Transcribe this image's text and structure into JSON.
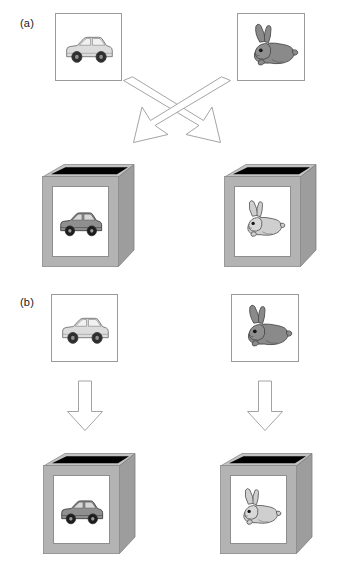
{
  "figure": {
    "background_color": "#ffffff",
    "panels": [
      {
        "id": "a",
        "label": "(a)",
        "condition": "crossed",
        "mapping_description": "car picture maps to rabbit box; rabbit picture maps to car box",
        "cards": [
          {
            "id": "a-card-car",
            "icon": "car-icon",
            "name": "car",
            "fill": "#dcdcdc",
            "stroke": "#6f6f6f"
          },
          {
            "id": "a-card-rabbit",
            "icon": "rabbit-icon",
            "name": "rabbit",
            "fill": "#8a8a8a",
            "stroke": "#4a4a4a"
          }
        ],
        "arrows": [
          {
            "id": "a-arrow-left",
            "icon": "arrow-down-left-icon",
            "direction": "down-left",
            "fill": "#ffffff",
            "stroke": "#9a9a9a"
          },
          {
            "id": "a-arrow-right",
            "icon": "arrow-down-right-icon",
            "direction": "down-right",
            "fill": "#ffffff",
            "stroke": "#9a9a9a"
          }
        ],
        "boxes": [
          {
            "id": "a-box-car",
            "icon": "car-icon",
            "name": "car",
            "front_fill": "#b3b3b3",
            "side_fill": "#9d9d9d",
            "top_fill": "#c2c2c2",
            "slot_fill": "#000000",
            "icon_fill": "#8f8f8f"
          },
          {
            "id": "a-box-rabbit",
            "icon": "rabbit-icon",
            "name": "rabbit",
            "front_fill": "#b3b3b3",
            "side_fill": "#9d9d9d",
            "top_fill": "#c2c2c2",
            "slot_fill": "#000000",
            "icon_fill": "#cfcfcf"
          }
        ]
      },
      {
        "id": "b",
        "label": "(b)",
        "condition": "matched",
        "mapping_description": "car picture maps to car box; rabbit picture maps to rabbit box",
        "cards": [
          {
            "id": "b-card-car",
            "icon": "car-icon",
            "name": "car",
            "fill": "#dcdcdc",
            "stroke": "#6f6f6f"
          },
          {
            "id": "b-card-rabbit",
            "icon": "rabbit-icon",
            "name": "rabbit",
            "fill": "#8a8a8a",
            "stroke": "#4a4a4a"
          }
        ],
        "arrows": [
          {
            "id": "b-arrow-left",
            "icon": "arrow-down-icon",
            "direction": "down",
            "fill": "#ffffff",
            "stroke": "#9a9a9a"
          },
          {
            "id": "b-arrow-right",
            "icon": "arrow-down-icon",
            "direction": "down",
            "fill": "#ffffff",
            "stroke": "#9a9a9a"
          }
        ],
        "boxes": [
          {
            "id": "b-box-car",
            "icon": "car-icon",
            "name": "car",
            "front_fill": "#b3b3b3",
            "side_fill": "#9d9d9d",
            "top_fill": "#c2c2c2",
            "slot_fill": "#000000",
            "icon_fill": "#8f8f8f"
          },
          {
            "id": "b-box-rabbit",
            "icon": "rabbit-icon",
            "name": "rabbit",
            "front_fill": "#b3b3b3",
            "side_fill": "#9d9d9d",
            "top_fill": "#c2c2c2",
            "slot_fill": "#000000",
            "icon_fill": "#cfcfcf"
          }
        ]
      }
    ]
  }
}
